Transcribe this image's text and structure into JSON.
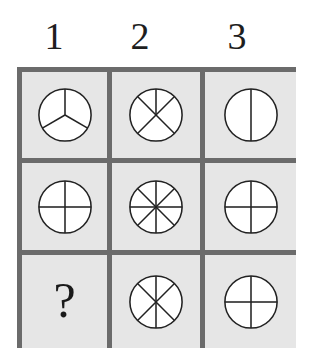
{
  "header": {
    "columns": [
      "1",
      "2",
      "3"
    ]
  },
  "grid": {
    "rows": 3,
    "cols": 3,
    "border_color": "#6b6b6b",
    "cell_background": "#e6e6e6",
    "cells": [
      {
        "row": 1,
        "col": 1,
        "type": "circle",
        "spokes_deg": [
          0,
          120,
          240
        ],
        "segments": 3
      },
      {
        "row": 1,
        "col": 2,
        "type": "circle",
        "spokes_deg": [
          0,
          45,
          135,
          225,
          315
        ],
        "segments": 5
      },
      {
        "row": 1,
        "col": 3,
        "type": "circle",
        "spokes_deg": [
          0,
          180
        ],
        "segments": 2
      },
      {
        "row": 2,
        "col": 1,
        "type": "circle",
        "spokes_deg": [
          0,
          90,
          180,
          270
        ],
        "segments": 4
      },
      {
        "row": 2,
        "col": 2,
        "type": "circle",
        "spokes_deg": [
          0,
          45,
          90,
          135,
          180,
          225,
          270,
          315
        ],
        "segments": 8
      },
      {
        "row": 2,
        "col": 3,
        "type": "circle",
        "spokes_deg": [
          0,
          90,
          180,
          270
        ],
        "segments": 4
      },
      {
        "row": 3,
        "col": 1,
        "type": "unknown",
        "text": "?"
      },
      {
        "row": 3,
        "col": 2,
        "type": "circle",
        "spokes_deg": [
          0,
          45,
          135,
          180,
          225,
          315
        ],
        "segments": 6
      },
      {
        "row": 3,
        "col": 3,
        "type": "circle",
        "spokes_deg": [
          0,
          90,
          180,
          270
        ],
        "segments": 4
      }
    ]
  }
}
